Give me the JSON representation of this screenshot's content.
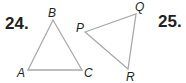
{
  "problems": [
    {
      "number": "24.",
      "triangle": {
        "vertices": [
          {
            "label": "A",
            "x": 28,
            "y": 70
          },
          {
            "label": "B",
            "x": 53,
            "y": 20
          },
          {
            "label": "C",
            "x": 82,
            "y": 70
          }
        ]
      }
    },
    {
      "number": "25.",
      "triangle": {
        "vertices": [
          {
            "label": "P",
            "x": 85,
            "y": 32
          },
          {
            "label": "Q",
            "x": 136,
            "y": 14
          },
          {
            "label": "R",
            "x": 128,
            "y": 69
          }
        ]
      }
    }
  ],
  "colors": {
    "stroke": "#a7a9ac",
    "text": "#231f20"
  }
}
